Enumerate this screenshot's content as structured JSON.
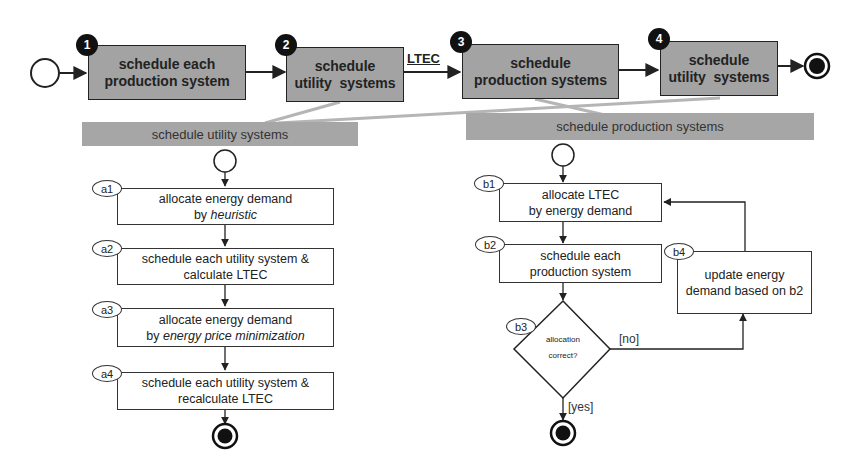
{
  "main_flow": {
    "steps": [
      {
        "number": "1",
        "line1": "schedule each",
        "line2": "production system"
      },
      {
        "number": "2",
        "line1": "schedule",
        "line2": "utility  systems"
      },
      {
        "number": "3",
        "line1": "schedule",
        "line2": "production systems"
      },
      {
        "number": "4",
        "line1": "schedule",
        "line2": "utility  systems"
      }
    ],
    "edge_label": "LTEC"
  },
  "utility_panel": {
    "title": "schedule utility systems",
    "steps": [
      {
        "tag": "a1",
        "line1": "allocate energy demand",
        "line2_prefix": "by ",
        "line2_italic": "heuristic",
        "line2": ""
      },
      {
        "tag": "a2",
        "line1": "schedule each utility system &",
        "line2": "calculate LTEC"
      },
      {
        "tag": "a3",
        "line1": "allocate energy demand",
        "line2_prefix": "by ",
        "line2_italic": "energy price minimization",
        "line2": ""
      },
      {
        "tag": "a4",
        "line1": "schedule each utility system &",
        "line2": "recalculate LTEC"
      }
    ]
  },
  "production_panel": {
    "title": "schedule production systems",
    "steps": [
      {
        "tag": "b1",
        "line1": "allocate LTEC",
        "line2": "by energy demand"
      },
      {
        "tag": "b2",
        "line1": "schedule each",
        "line2": "production system"
      },
      {
        "tag": "b3",
        "line1": "allocation",
        "line2": "correct?"
      },
      {
        "tag": "b4",
        "line1": "update energy",
        "line2": "demand based on b2"
      }
    ],
    "guard_no": "[no]",
    "guard_yes": "[yes]"
  },
  "colors": {
    "activity_fill": "#a3a3a3",
    "panel_header": "#a6a6a6",
    "panel_body": "#eaeaea",
    "stroke": "#222222"
  }
}
